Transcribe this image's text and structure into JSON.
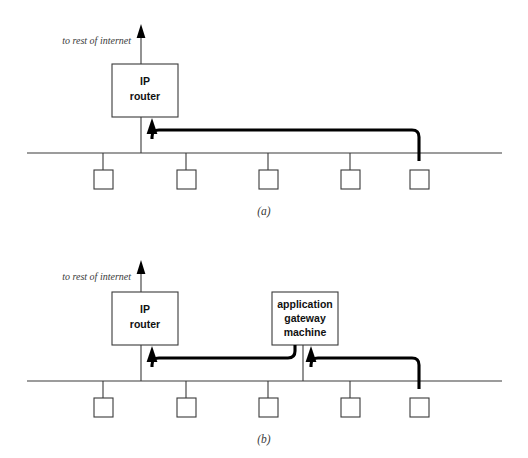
{
  "figure": {
    "background_color": "#ffffff",
    "line_color": "#3a3a3a",
    "cable_color": "#000000"
  },
  "panels": [
    {
      "caption": "(a)",
      "internet_label": "to rest of internet",
      "router": {
        "line1": "IP",
        "line2": "router"
      },
      "gateway": null,
      "host_count": 5,
      "hosts": [
        {
          "name": "host-1"
        },
        {
          "name": "host-2"
        },
        {
          "name": "host-3"
        },
        {
          "name": "host-4"
        },
        {
          "name": "host-5"
        }
      ]
    },
    {
      "caption": "(b)",
      "internet_label": "to rest of internet",
      "router": {
        "line1": "IP",
        "line2": "router"
      },
      "gateway": {
        "line1": "application",
        "line2": "gateway",
        "line3": "machine"
      },
      "host_count": 5,
      "hosts": [
        {
          "name": "host-1"
        },
        {
          "name": "host-2"
        },
        {
          "name": "host-3"
        },
        {
          "name": "host-4"
        },
        {
          "name": "host-5"
        }
      ]
    }
  ]
}
